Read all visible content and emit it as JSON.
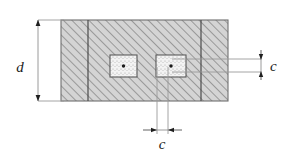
{
  "figure": {
    "type": "engineering-cross-section-diagram",
    "background_color": "#ffffff",
    "line_color": "#3c3c3c",
    "dimension_line_color": "#6e6e6e",
    "hatch_fill_color": "#d2d2d2",
    "hatch_line_color": "#8c8c8c",
    "cavity_fill_color": "#f2f2f2",
    "cavity_speckle_color": "#a8a8a8"
  },
  "section": {
    "name": "hatched-section",
    "x": 61,
    "y": 20,
    "width": 167,
    "height": 81,
    "internal_dividers_x": [
      88,
      201
    ]
  },
  "cavities": [
    {
      "name": "left-cavity",
      "x": 110,
      "y": 55,
      "width": 27,
      "height": 22,
      "center_x": 123.5,
      "center_y": 66
    },
    {
      "name": "right-cavity",
      "x": 156,
      "y": 55,
      "width": 30,
      "height": 22,
      "center_x": 171,
      "center_y": 66
    }
  ],
  "dimensions": [
    {
      "name": "depth-dimension",
      "label": "d",
      "orientation": "vertical",
      "line_x": 38,
      "from_y": 20,
      "to_y": 101,
      "label_x": 20,
      "label_y": 67,
      "arrow_style": "inward",
      "extension_from_x": 38,
      "extension_to_x": 64
    },
    {
      "name": "cover-dimension-right",
      "label": "c",
      "orientation": "vertical",
      "line_x": 261,
      "from_y": 50,
      "to_y": 80,
      "label_x": 270,
      "label_y": 71,
      "arrow_style": "inward",
      "leader_y_top": 59,
      "leader_y_bottom": 72,
      "leader_from_x": 172,
      "leader_to_x": 261
    },
    {
      "name": "spacing-dimension-bottom",
      "label": "c",
      "orientation": "horizontal",
      "line_y": 130,
      "from_x": 143,
      "to_x": 182,
      "label_x": 162,
      "label_y": 147,
      "arrow_style": "inward",
      "extension_x_left": 157,
      "extension_x_right": 168,
      "extension_from_y": 67,
      "extension_to_y": 134
    }
  ]
}
